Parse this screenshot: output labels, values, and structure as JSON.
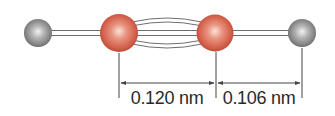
{
  "diagram": {
    "type": "molecule-bond-length",
    "molecule": "acetylene (H-C≡C-H)",
    "atoms": [
      {
        "id": "H1",
        "element": "H",
        "color": "#8c8c8c"
      },
      {
        "id": "C1",
        "element": "C",
        "color": "#d9634f"
      },
      {
        "id": "C2",
        "element": "C",
        "color": "#d9634f"
      },
      {
        "id": "H2",
        "element": "H",
        "color": "#8c8c8c"
      }
    ],
    "bonds": [
      {
        "from": "H1",
        "to": "C1",
        "order": 1
      },
      {
        "from": "C1",
        "to": "C2",
        "order": 3
      },
      {
        "from": "C2",
        "to": "H2",
        "order": 1
      }
    ],
    "dimensions": [
      {
        "from": "C1",
        "to": "C2",
        "label": "0.120 nm",
        "value": 0.12,
        "unit": "nm"
      },
      {
        "from": "C2",
        "to": "H2",
        "label": "0.106 nm",
        "value": 0.106,
        "unit": "nm"
      }
    ],
    "colors": {
      "bond_stroke": "#6e6e6e",
      "bond_fill": "#ffffff",
      "dimension_line": "#444444",
      "text": "#2a2a2a"
    }
  }
}
